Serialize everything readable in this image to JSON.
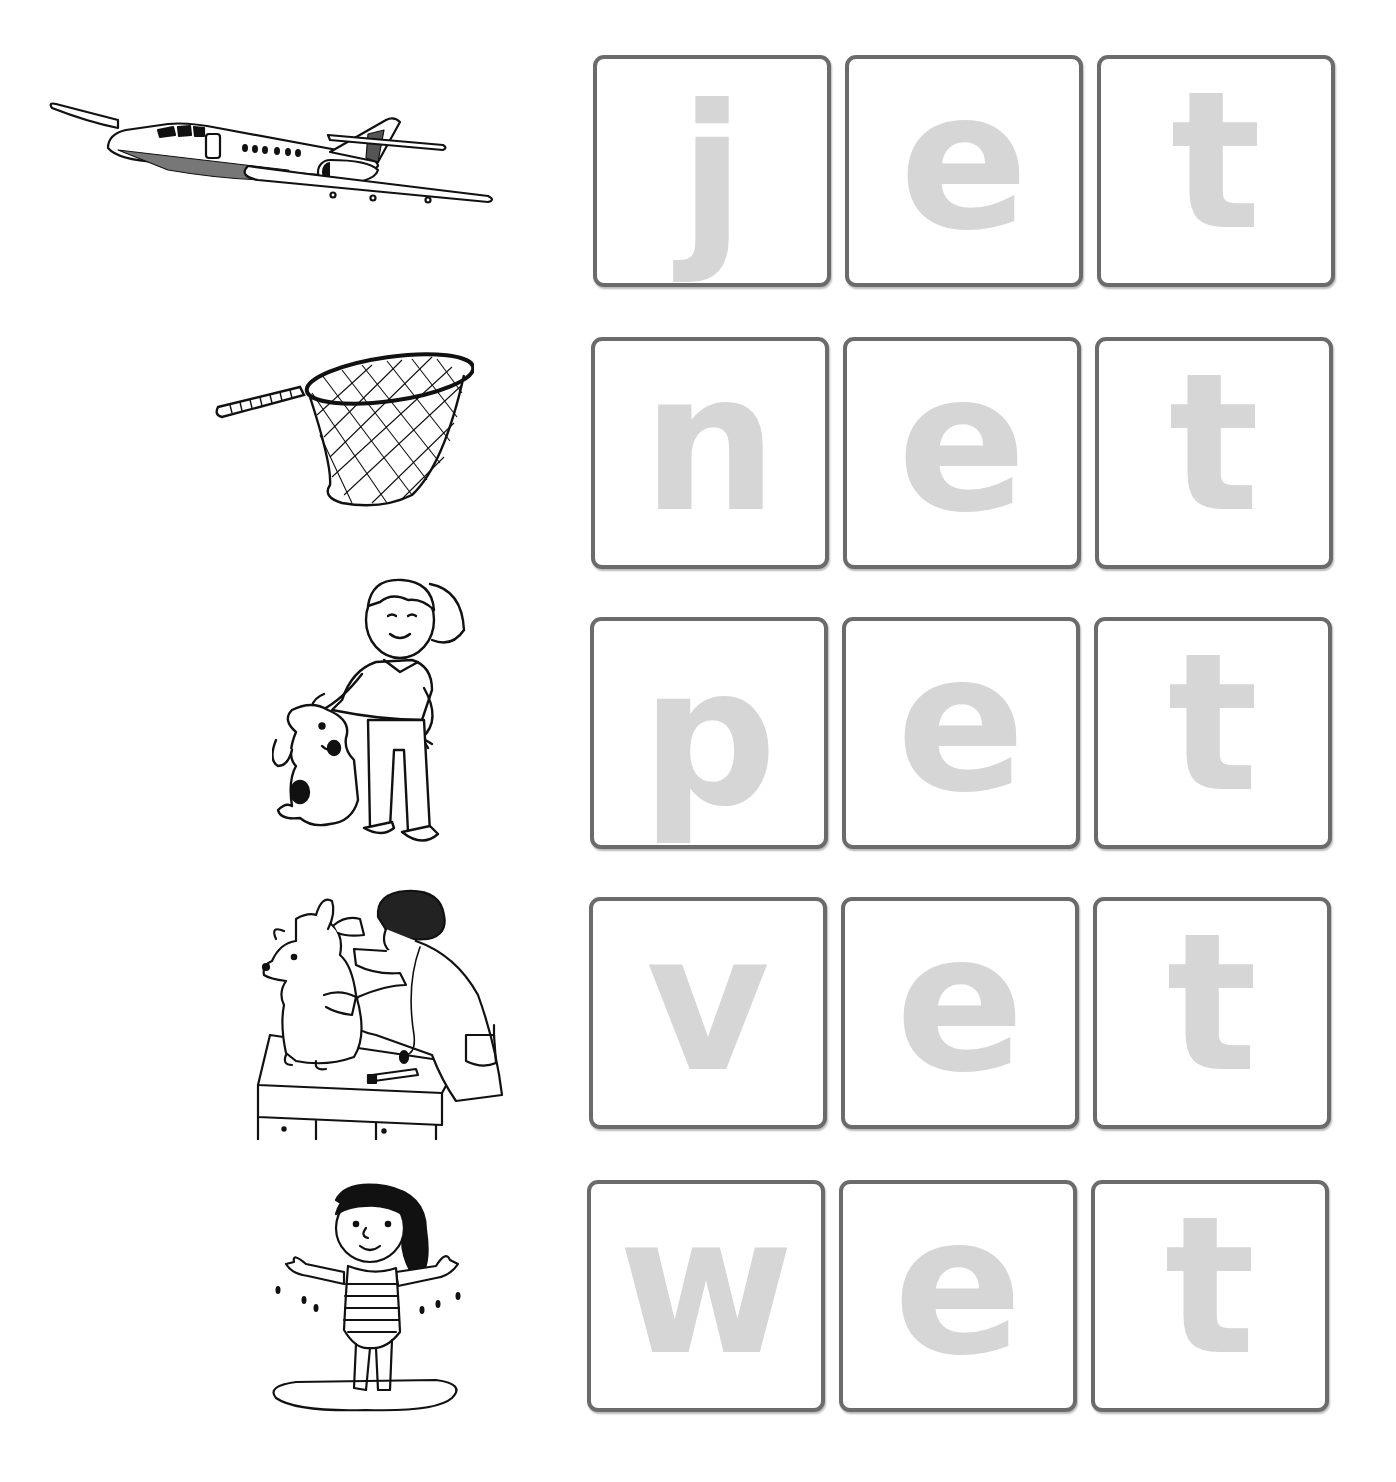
{
  "worksheet": {
    "theme": "-et word family",
    "colors": {
      "tile_border": "#6b6b6b",
      "letter_fill": "#d6d6d6",
      "background": "#ffffff"
    },
    "rows": [
      {
        "word": "jet",
        "picture": "jet-airplane",
        "letters": [
          "j",
          "e",
          "t"
        ]
      },
      {
        "word": "net",
        "picture": "butterfly-net",
        "letters": [
          "n",
          "e",
          "t"
        ]
      },
      {
        "word": "pet",
        "picture": "girl-petting-dog",
        "letters": [
          "p",
          "e",
          "t"
        ]
      },
      {
        "word": "vet",
        "picture": "veterinarian-examining-dog",
        "letters": [
          "v",
          "e",
          "t"
        ]
      },
      {
        "word": "wet",
        "picture": "wet-girl-in-swimsuit",
        "letters": [
          "w",
          "e",
          "t"
        ]
      }
    ]
  }
}
